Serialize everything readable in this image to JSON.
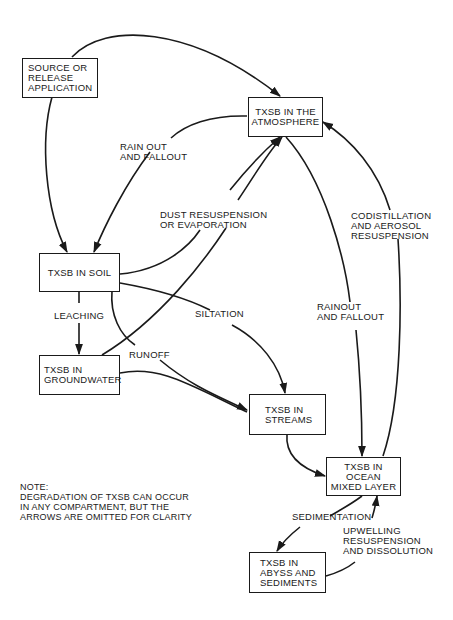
{
  "diagram": {
    "type": "flow-diagram",
    "nodes": {
      "source": {
        "lines": [
          "SOURCE OR",
          "RELEASE",
          "APPLICATION"
        ]
      },
      "atmosphere": {
        "lines": [
          "TXSB IN THE",
          "ATMOSPHERE"
        ]
      },
      "soil": {
        "lines": [
          "TXSB IN SOIL"
        ]
      },
      "groundwater": {
        "lines": [
          "TXSB IN",
          "GROUNDWATER"
        ]
      },
      "streams": {
        "lines": [
          "TXSB IN",
          "STREAMS"
        ]
      },
      "ocean": {
        "lines": [
          "TXSB IN OCEAN",
          "MIXED LAYER"
        ]
      },
      "abyss": {
        "lines": [
          "TXSB IN",
          "ABYSS AND",
          "SEDIMENTS"
        ]
      }
    },
    "edge_labels": {
      "rain_out": [
        "RAIN OUT",
        "AND FALLOUT"
      ],
      "dust": [
        "DUST RESUSPENSION",
        "OR EVAPORATION"
      ],
      "codistillation": [
        "CODISTILLATION",
        "AND AEROSOL",
        "RESUSPENSION"
      ],
      "rainout_ocean": [
        "RAINOUT",
        "AND FALLOUT"
      ],
      "leaching": [
        "LEACHING"
      ],
      "siltation": [
        "SILTATION"
      ],
      "runoff": [
        "RUNOFF"
      ],
      "sedimentation": [
        "SEDIMENTATION"
      ],
      "upwelling": [
        "UPWELLING",
        "RESUSPENSION",
        "AND DISSOLUTION"
      ]
    },
    "edges": [
      {
        "from": "source",
        "to": "atmosphere",
        "label": ""
      },
      {
        "from": "source",
        "to": "soil",
        "label": ""
      },
      {
        "from": "atmosphere",
        "to": "soil",
        "label": "RAIN OUT AND FALLOUT"
      },
      {
        "from": "soil",
        "to": "atmosphere",
        "label": "DUST RESUSPENSION OR EVAPORATION"
      },
      {
        "from": "groundwater",
        "to": "atmosphere",
        "label": "DUST RESUSPENSION OR EVAPORATION"
      },
      {
        "from": "atmosphere",
        "to": "ocean",
        "label": "RAINOUT AND FALLOUT"
      },
      {
        "from": "ocean",
        "to": "atmosphere",
        "label": "CODISTILLATION AND AEROSOL RESUSPENSION"
      },
      {
        "from": "soil",
        "to": "groundwater",
        "label": "LEACHING"
      },
      {
        "from": "soil",
        "to": "streams",
        "label": "SILTATION"
      },
      {
        "from": "soil",
        "to": "streams",
        "label": "RUNOFF"
      },
      {
        "from": "groundwater",
        "to": "streams",
        "label": ""
      },
      {
        "from": "streams",
        "to": "ocean",
        "label": ""
      },
      {
        "from": "ocean",
        "to": "abyss",
        "label": "SEDIMENTATION"
      },
      {
        "from": "abyss",
        "to": "ocean",
        "label": "UPWELLING RESUSPENSION AND DISSOLUTION"
      }
    ],
    "note": {
      "title": "NOTE:",
      "lines": [
        "DEGRADATION OF TXSB CAN OCCUR",
        "IN ANY COMPARTMENT, BUT THE",
        "ARROWS ARE OMITTED FOR CLARITY"
      ]
    },
    "colors": {
      "ink": "#1a1a1a",
      "background": "#ffffff"
    }
  }
}
